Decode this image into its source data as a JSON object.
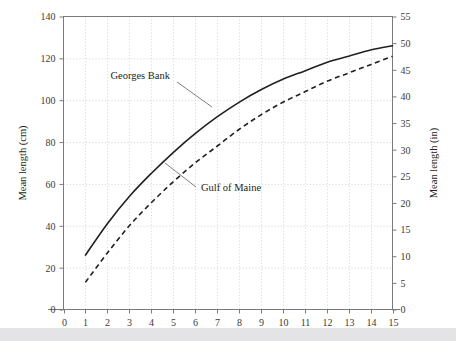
{
  "chart_data": {
    "type": "line",
    "title": "",
    "subtitle": "",
    "xlabel": "",
    "ylabel": "Mean length (cm)",
    "y2label": "Mean length (in)",
    "xlim": [
      0,
      15
    ],
    "ylim": [
      0,
      140
    ],
    "y2lim": [
      0,
      55
    ],
    "grid": true,
    "legend_position": "inline-annotation",
    "x_ticks": [
      0,
      1,
      2,
      3,
      4,
      5,
      6,
      7,
      8,
      9,
      10,
      11,
      12,
      13,
      14,
      15
    ],
    "x_tick_labels": [
      "0",
      "1",
      "2",
      "3",
      "4",
      "5",
      "6",
      "7",
      "8",
      "9",
      "10",
      "11",
      "12",
      "13",
      "14",
      "15"
    ],
    "y_ticks": [
      0,
      20,
      40,
      60,
      80,
      100,
      120,
      140
    ],
    "y_tick_labels": [
      "0",
      "20",
      "40",
      "60",
      "80",
      "100",
      "120",
      "140"
    ],
    "y2_ticks": [
      0,
      5,
      10,
      15,
      20,
      25,
      30,
      35,
      40,
      45,
      50,
      55
    ],
    "y2_tick_labels": [
      "0",
      "5",
      "10",
      "15",
      "20",
      "25",
      "30",
      "35",
      "40",
      "45",
      "50",
      "55"
    ],
    "x": [
      1,
      2,
      3,
      4,
      5,
      6,
      7,
      8,
      9,
      10,
      11,
      12,
      13,
      14,
      15
    ],
    "series": [
      {
        "name": "Georges Bank",
        "style": "solid",
        "color": "#231f20",
        "values": [
          26,
          41,
          54,
          65,
          75,
          84,
          92,
          99,
          105,
          110,
          114,
          118,
          121,
          124,
          126
        ]
      },
      {
        "name": "Gulf of Maine",
        "style": "dashed",
        "color": "#231f20",
        "values": [
          13,
          27,
          40,
          51,
          61,
          70,
          78,
          86,
          93,
          99,
          104,
          109,
          113,
          117,
          121
        ]
      }
    ],
    "annotations": [
      {
        "text": "Georges Bank",
        "series": "Georges Bank",
        "x": 5.0,
        "y": 108
      },
      {
        "text": "Gulf of Maine",
        "series": "Gulf of Maine",
        "x": 6.6,
        "y": 57
      }
    ]
  },
  "figure": {
    "footer_band_color": "#e4e4e6",
    "background_color": "#ffffff"
  }
}
